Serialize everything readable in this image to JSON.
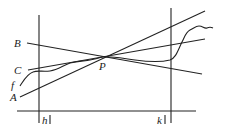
{
  "diagram": {
    "type": "geometry-figure",
    "labels": {
      "line_a": "A",
      "line_b": "B",
      "line_c": "C",
      "curve_f": "f",
      "point_p": "P",
      "tick_h": "h",
      "tick_k": "k"
    },
    "stroke_color": "#222222",
    "background_color": "#ffffff"
  }
}
